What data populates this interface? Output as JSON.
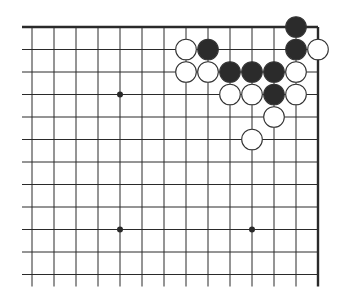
{
  "diagram": {
    "type": "go-board-fragment",
    "colors": {
      "background": "#ffffff",
      "line": "#2a2a2a",
      "black_stone": "#2b2b2b",
      "white_stone": "#ffffff",
      "stone_outline": "#333333"
    },
    "grid": {
      "columns": 14,
      "rows": 12,
      "origin_x": 32,
      "origin_y": 27,
      "spacing_x": 22,
      "spacing_y": 22.5,
      "top_edge": true,
      "right_edge": true,
      "lines_extend_left": 10,
      "lines_extend_bottom": 12
    },
    "star_points": [
      {
        "col": 4,
        "row": 3
      },
      {
        "col": 4,
        "row": 9
      },
      {
        "col": 10,
        "row": 9
      }
    ],
    "stones": [
      {
        "color": "black",
        "col": 12,
        "row": 0
      },
      {
        "color": "white",
        "col": 7,
        "row": 1
      },
      {
        "color": "black",
        "col": 8,
        "row": 1
      },
      {
        "color": "black",
        "col": 12,
        "row": 1
      },
      {
        "color": "white",
        "col": 13,
        "row": 1
      },
      {
        "color": "white",
        "col": 7,
        "row": 2
      },
      {
        "color": "white",
        "col": 8,
        "row": 2
      },
      {
        "color": "black",
        "col": 9,
        "row": 2
      },
      {
        "color": "black",
        "col": 10,
        "row": 2
      },
      {
        "color": "black",
        "col": 11,
        "row": 2
      },
      {
        "color": "white",
        "col": 12,
        "row": 2
      },
      {
        "color": "white",
        "col": 9,
        "row": 3
      },
      {
        "color": "white",
        "col": 10,
        "row": 3
      },
      {
        "color": "black",
        "col": 11,
        "row": 3
      },
      {
        "color": "white",
        "col": 12,
        "row": 3
      },
      {
        "color": "white",
        "col": 11,
        "row": 4
      },
      {
        "color": "white",
        "col": 10,
        "row": 5
      }
    ],
    "stone_counts": {
      "black": 7,
      "white": 10
    }
  }
}
